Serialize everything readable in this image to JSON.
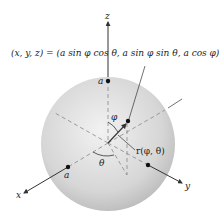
{
  "figure": {
    "equation": "(x, y, z) = (a sin φ cos θ, a sin φ sin θ, a cos φ)",
    "axis_labels": {
      "x": "x",
      "y": "y",
      "z": "z"
    },
    "point_labels": {
      "a_top": "a",
      "a_x": "a"
    },
    "angle_labels": {
      "phi": "φ",
      "theta": "θ"
    },
    "vector_label": "r(φ, θ)",
    "colors": {
      "sphere_light": "#f2f2f2",
      "sphere_dark": "#b8b8b8",
      "axis": "#333333",
      "dashed": "#888888"
    }
  }
}
